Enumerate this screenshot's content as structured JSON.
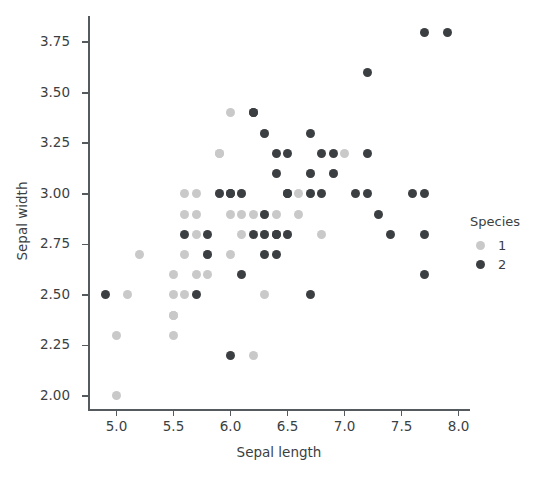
{
  "chart_data": {
    "type": "scatter",
    "title": "",
    "xlabel": "Sepal length",
    "ylabel": "Sepal width",
    "xlim": [
      4.75,
      8.1
    ],
    "ylim": [
      1.93,
      3.88
    ],
    "xticks": [
      "5.0",
      "5.5",
      "6.0",
      "6.5",
      "7.0",
      "7.5",
      "8.0"
    ],
    "xtick_values": [
      5.0,
      5.5,
      6.0,
      6.5,
      7.0,
      7.5,
      8.0
    ],
    "yticks": [
      "2.00",
      "2.25",
      "2.50",
      "2.75",
      "3.00",
      "3.25",
      "3.50",
      "3.75"
    ],
    "ytick_values": [
      2.0,
      2.25,
      2.5,
      2.75,
      3.0,
      3.25,
      3.5,
      3.75
    ],
    "grid": false,
    "legend": {
      "title": "Species",
      "position": "right",
      "entries": [
        {
          "label": "1",
          "color": "#c9c9c9"
        },
        {
          "label": "2",
          "color": "#3c3f42"
        }
      ]
    },
    "series": [
      {
        "name": "1",
        "color": "#c9c9c9",
        "points": [
          [
            5.0,
            2.0
          ],
          [
            5.0,
            2.3
          ],
          [
            5.1,
            2.5
          ],
          [
            5.2,
            2.7
          ],
          [
            5.5,
            2.3
          ],
          [
            5.5,
            2.4
          ],
          [
            5.5,
            2.4
          ],
          [
            5.5,
            2.5
          ],
          [
            5.5,
            2.6
          ],
          [
            5.6,
            2.5
          ],
          [
            5.6,
            2.7
          ],
          [
            5.6,
            2.9
          ],
          [
            5.6,
            3.0
          ],
          [
            5.7,
            2.6
          ],
          [
            5.7,
            2.8
          ],
          [
            5.7,
            2.9
          ],
          [
            5.7,
            3.0
          ],
          [
            5.8,
            2.6
          ],
          [
            5.8,
            2.7
          ],
          [
            5.8,
            2.7
          ],
          [
            5.9,
            3.0
          ],
          [
            5.9,
            3.2
          ],
          [
            6.0,
            2.7
          ],
          [
            6.0,
            2.9
          ],
          [
            6.1,
            2.8
          ],
          [
            6.1,
            2.9
          ],
          [
            6.1,
            3.0
          ],
          [
            6.2,
            2.2
          ],
          [
            6.2,
            2.9
          ],
          [
            6.3,
            2.5
          ],
          [
            6.3,
            2.8
          ],
          [
            6.3,
            2.9
          ],
          [
            6.4,
            2.9
          ],
          [
            6.5,
            2.8
          ],
          [
            6.6,
            2.9
          ],
          [
            6.6,
            3.0
          ],
          [
            6.7,
            3.0
          ],
          [
            6.7,
            3.1
          ],
          [
            6.8,
            2.8
          ],
          [
            6.9,
            3.1
          ],
          [
            7.0,
            3.2
          ],
          [
            6.0,
            3.4
          ],
          [
            5.9,
            3.2
          ],
          [
            6.3,
            3.3
          ]
        ]
      },
      {
        "name": "2",
        "color": "#3c3f42",
        "points": [
          [
            4.9,
            2.5
          ],
          [
            5.6,
            2.8
          ],
          [
            5.7,
            2.5
          ],
          [
            5.8,
            2.7
          ],
          [
            5.8,
            2.8
          ],
          [
            5.9,
            3.0
          ],
          [
            6.0,
            2.2
          ],
          [
            6.0,
            3.0
          ],
          [
            6.1,
            2.6
          ],
          [
            6.1,
            3.0
          ],
          [
            6.2,
            2.8
          ],
          [
            6.2,
            3.4
          ],
          [
            6.2,
            3.4
          ],
          [
            6.3,
            2.7
          ],
          [
            6.3,
            2.8
          ],
          [
            6.3,
            2.9
          ],
          [
            6.3,
            3.3
          ],
          [
            6.4,
            2.7
          ],
          [
            6.4,
            2.8
          ],
          [
            6.4,
            3.1
          ],
          [
            6.4,
            3.2
          ],
          [
            6.5,
            3.0
          ],
          [
            6.5,
            3.0
          ],
          [
            6.5,
            3.2
          ],
          [
            6.7,
            2.5
          ],
          [
            6.7,
            3.0
          ],
          [
            6.7,
            3.1
          ],
          [
            6.7,
            3.3
          ],
          [
            6.8,
            3.0
          ],
          [
            6.8,
            3.2
          ],
          [
            6.9,
            3.1
          ],
          [
            6.9,
            3.2
          ],
          [
            7.1,
            3.0
          ],
          [
            7.2,
            3.0
          ],
          [
            7.2,
            3.2
          ],
          [
            7.2,
            3.6
          ],
          [
            7.3,
            2.9
          ],
          [
            7.4,
            2.8
          ],
          [
            7.6,
            3.0
          ],
          [
            7.7,
            2.6
          ],
          [
            7.7,
            2.8
          ],
          [
            7.7,
            3.0
          ],
          [
            7.7,
            3.8
          ],
          [
            7.9,
            3.8
          ],
          [
            6.0,
            3.0
          ],
          [
            6.5,
            2.8
          ],
          [
            6.4,
            2.8
          ]
        ]
      }
    ]
  }
}
